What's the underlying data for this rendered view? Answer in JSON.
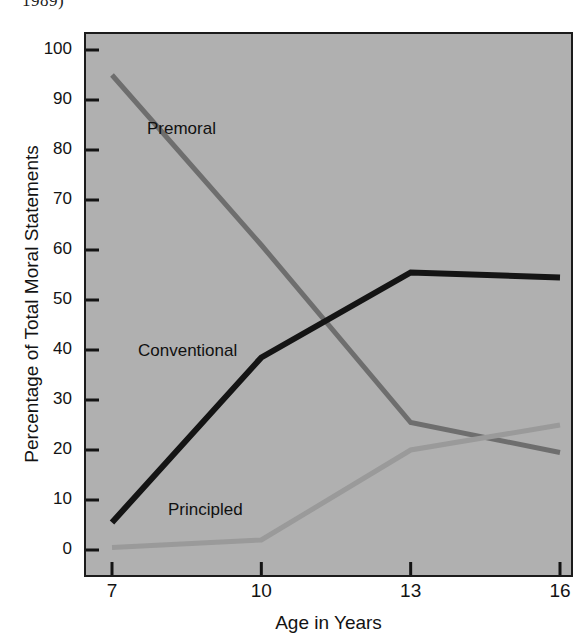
{
  "figure": {
    "clipped_caption_above": "1989)"
  },
  "chart_data": {
    "type": "line",
    "title": "",
    "xlabel": "Age in Years",
    "ylabel": "Percentage of Total Moral Statements",
    "x": [
      7,
      10,
      13,
      16
    ],
    "xticklabels": [
      "7",
      "10",
      "13",
      "16"
    ],
    "yticks": [
      0,
      10,
      20,
      30,
      40,
      50,
      60,
      70,
      80,
      90,
      100
    ],
    "yticklabels": [
      "0",
      "10",
      "20",
      "30",
      "40",
      "50",
      "60",
      "70",
      "80",
      "90",
      "100"
    ],
    "xlim": [
      6.55,
      16.6
    ],
    "ylim": [
      -2,
      104
    ],
    "grid": false,
    "legend": "inline-labels",
    "plot_background": "#b0b0b0",
    "series": [
      {
        "name": "Premoral",
        "color": "#6e6e6e",
        "linewidth": 5,
        "values": [
          95,
          61,
          25.5,
          19.5
        ],
        "label_position": "upper-left"
      },
      {
        "name": "Conventional",
        "color": "#141414",
        "linewidth": 6,
        "values": [
          5.5,
          38.5,
          55.5,
          54.5
        ],
        "label_position": "middle-left"
      },
      {
        "name": "Principled",
        "color": "#9a9a9a",
        "linewidth": 5,
        "values": [
          0.5,
          2,
          20,
          25
        ],
        "label_position": "lower-left"
      }
    ],
    "annotations": [
      {
        "text": "Premoral",
        "x": 8.0,
        "y": 78
      },
      {
        "text": "Conventional",
        "x": 7.9,
        "y": 43
      },
      {
        "text": "Principled",
        "x": 8.4,
        "y": 10
      }
    ]
  }
}
